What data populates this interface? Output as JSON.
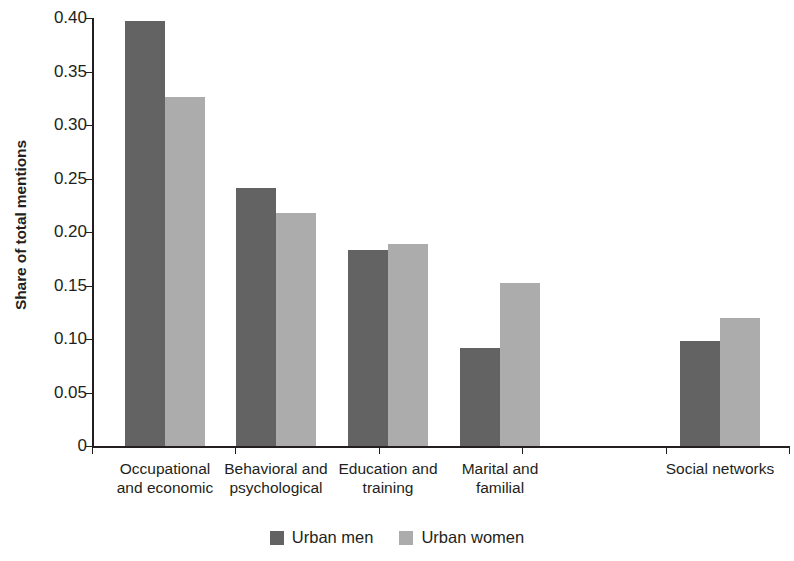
{
  "chart_data": {
    "type": "bar",
    "title": "",
    "xlabel": "",
    "ylabel": "Share of total mentions",
    "ylim": [
      0,
      0.4
    ],
    "ytick_labels": [
      "0.40",
      "0.35",
      "0.30",
      "0.25",
      "0.20",
      "0.15",
      "0.10",
      "0.05",
      "0"
    ],
    "ytick_values": [
      0.4,
      0.35,
      0.3,
      0.25,
      0.2,
      0.15,
      0.1,
      0.05,
      0
    ],
    "grid": false,
    "legend_position": "bottom-center",
    "categories": [
      {
        "line1": "Occupational",
        "line2": "and economic"
      },
      {
        "line1": "Behavioral and",
        "line2": "psychological"
      },
      {
        "line1": "Education and",
        "line2": "training"
      },
      {
        "line1": "Marital and",
        "line2": "familial"
      },
      {
        "line1": "Social networks",
        "line2": ""
      }
    ],
    "series": [
      {
        "name": "Urban men",
        "color": "#636363",
        "values": [
          0.397,
          0.241,
          0.183,
          0.092,
          0.098
        ]
      },
      {
        "name": "Urban women",
        "color": "#acacac",
        "values": [
          0.326,
          0.218,
          0.189,
          0.152,
          0.12
        ]
      }
    ]
  }
}
